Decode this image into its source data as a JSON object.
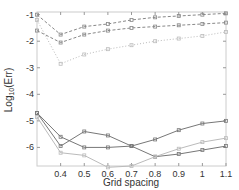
{
  "chart_data": {
    "type": "line",
    "title": "",
    "xlabel": "Grid spacing",
    "ylabel": "Log10(Err)",
    "xlim": [
      0.3,
      1.1
    ],
    "ylim": [
      -6.7,
      -0.9
    ],
    "x": [
      0.3,
      0.4,
      0.5,
      0.6,
      0.7,
      0.8,
      0.9,
      1.0,
      1.1
    ],
    "x_ticks": [
      "0.4",
      "0.5",
      "0.6",
      "0.7",
      "0.8",
      "0.9",
      "1",
      "1.1"
    ],
    "y_ticks": [
      "-1",
      "-2",
      "-3",
      "-4",
      "-5",
      "-6"
    ],
    "grid": false,
    "series": [
      {
        "name": "dashed-upper",
        "style": "dashed",
        "values": [
          -1.0,
          -1.75,
          -1.45,
          -1.35,
          -1.2,
          -1.1,
          -1.05,
          -1.0,
          -0.95
        ]
      },
      {
        "name": "dashed-middle",
        "style": "dashed",
        "values": [
          -1.6,
          -2.05,
          -1.75,
          -1.6,
          -1.5,
          -1.45,
          -1.4,
          -1.35,
          -1.3
        ]
      },
      {
        "name": "dotted-lower",
        "style": "dotted",
        "values": [
          -1.2,
          -2.85,
          -2.5,
          -2.3,
          -2.15,
          -2.0,
          -1.9,
          -1.8,
          -1.65
        ]
      },
      {
        "name": "solid-a",
        "style": "solid",
        "values": [
          -4.7,
          -5.95,
          -5.4,
          -5.55,
          -5.95,
          -5.7,
          -5.35,
          -5.1,
          -5.0
        ]
      },
      {
        "name": "solid-b",
        "style": "solid",
        "values": [
          -4.7,
          -5.6,
          -6.0,
          -6.0,
          -5.95,
          -6.35,
          -6.25,
          -6.1,
          -5.95
        ]
      },
      {
        "name": "solid-c",
        "style": "solid",
        "values": [
          -4.85,
          -6.2,
          -6.3,
          -6.75,
          -6.7,
          -6.35,
          -6.05,
          -5.8,
          -5.65
        ]
      }
    ],
    "legend": null
  }
}
